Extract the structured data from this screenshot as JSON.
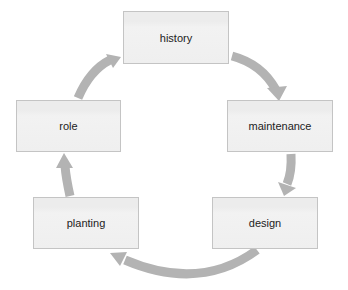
{
  "diagram": {
    "type": "cycle",
    "colors": {
      "node_fill": "#efefef",
      "node_border": "#c4c4c4",
      "arrow": "#b3b3b3",
      "text": "#222222",
      "background": "#ffffff"
    },
    "nodes": [
      {
        "id": "history",
        "label": "history"
      },
      {
        "id": "maintenance",
        "label": "maintenance"
      },
      {
        "id": "design",
        "label": "design"
      },
      {
        "id": "planting",
        "label": "planting"
      },
      {
        "id": "role",
        "label": "role"
      }
    ],
    "edges": [
      {
        "from": "history",
        "to": "maintenance"
      },
      {
        "from": "maintenance",
        "to": "design"
      },
      {
        "from": "design",
        "to": "planting"
      },
      {
        "from": "planting",
        "to": "role"
      },
      {
        "from": "role",
        "to": "history"
      }
    ]
  }
}
